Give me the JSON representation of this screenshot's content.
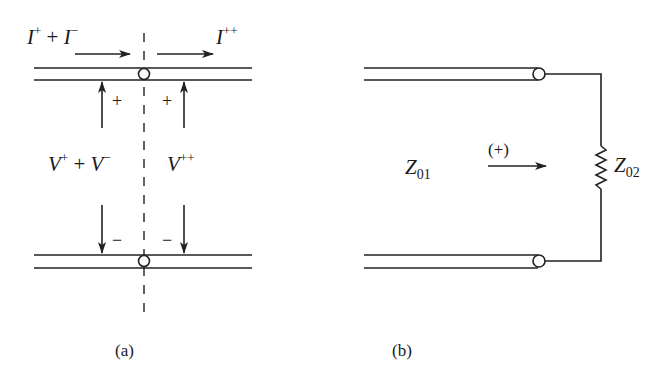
{
  "panels": {
    "a": {
      "caption": "(a)",
      "current_left": {
        "base": "I",
        "sup1": "+",
        "plus": " + ",
        "base2": "I",
        "sup2": "−"
      },
      "current_right": {
        "base": "I",
        "sup": "++"
      },
      "voltage_left": {
        "base": "V",
        "sup1": "+",
        "plus": " + ",
        "base2": "V",
        "sup2": "−"
      },
      "voltage_right": {
        "base": "V",
        "sup": "++"
      },
      "polarity_plus": "+",
      "polarity_minus": "−"
    },
    "b": {
      "caption": "(b)",
      "line_impedance": {
        "base": "Z",
        "sub": "01"
      },
      "load_impedance": {
        "base": "Z",
        "sub": "02"
      },
      "direction_label": "(+)"
    }
  },
  "colors": {
    "ink": "#222222",
    "background": "#ffffff"
  }
}
